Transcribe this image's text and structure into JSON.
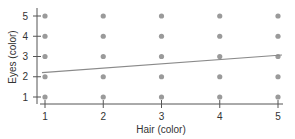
{
  "chart_data": {
    "type": "scatter",
    "title": "",
    "xlabel": "Hair (color)",
    "ylabel": "Eyes (color)",
    "xlim": [
      1,
      5
    ],
    "ylim": [
      1,
      5
    ],
    "x_ticks": [
      "1",
      "2",
      "3",
      "4",
      "5"
    ],
    "y_ticks": [
      "1",
      "2",
      "3",
      "4",
      "5"
    ],
    "grid": false,
    "legend": null,
    "series": [
      {
        "name": "observations",
        "points": [
          [
            1,
            1
          ],
          [
            1,
            2
          ],
          [
            1,
            3
          ],
          [
            1,
            4
          ],
          [
            1,
            5
          ],
          [
            2,
            1
          ],
          [
            2,
            2
          ],
          [
            2,
            3
          ],
          [
            2,
            4
          ],
          [
            2,
            5
          ],
          [
            3,
            1
          ],
          [
            3,
            2
          ],
          [
            3,
            3
          ],
          [
            3,
            4
          ],
          [
            3,
            5
          ],
          [
            4,
            1
          ],
          [
            4,
            2
          ],
          [
            4,
            3
          ],
          [
            4,
            4
          ],
          [
            4,
            5
          ],
          [
            5,
            1
          ],
          [
            5,
            2
          ],
          [
            5,
            3
          ],
          [
            5,
            4
          ],
          [
            5,
            5
          ]
        ],
        "color": "#999999"
      },
      {
        "name": "regression line",
        "type": "line",
        "points": [
          [
            1,
            2.2
          ],
          [
            5,
            3.05
          ]
        ],
        "color": "#888888"
      }
    ]
  },
  "colors": {
    "points": "#9a9a9a",
    "line": "#8a8a8a",
    "axis": "#555555"
  }
}
